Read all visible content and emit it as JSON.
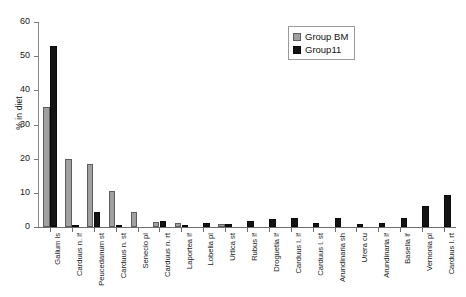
{
  "chart_data": {
    "type": "bar",
    "title": "",
    "xlabel": "",
    "ylabel": "% in diet",
    "ylim": [
      0,
      60
    ],
    "yticks": [
      0,
      10,
      20,
      30,
      40,
      50,
      60
    ],
    "grid": false,
    "legend_position": "top-right",
    "categories": [
      "Galium ls",
      "Carduus n. lf",
      "Peucedanum st",
      "Carduus n. st",
      "Senecio pl",
      "Carduus n. rt",
      "Laportea lf",
      "Lobelia pl",
      "Urtica st",
      "Rubus lf",
      "Droguetia lf",
      "Carduus l. lf",
      "Carduus l. st",
      "Arundinaria sh",
      "Urera cu",
      "Arundinaria lf",
      "Basella lf",
      "Vernonia pl",
      "Carduus l. rt"
    ],
    "series": [
      {
        "name": "Group BM",
        "color": "#a0a0a0",
        "values": [
          35,
          20,
          18.5,
          10.5,
          4.5,
          1.5,
          1.2,
          0,
          0.8,
          0,
          0,
          0,
          0,
          0,
          0,
          0,
          0,
          0,
          0
        ]
      },
      {
        "name": "Group11",
        "color": "#141414",
        "values": [
          53,
          0.3,
          4.5,
          0.3,
          0,
          1.8,
          0.5,
          1.3,
          0.8,
          1.8,
          2.2,
          2.5,
          1.3,
          2.5,
          1.0,
          1.2,
          2.5,
          6.2,
          9.5
        ]
      }
    ]
  }
}
